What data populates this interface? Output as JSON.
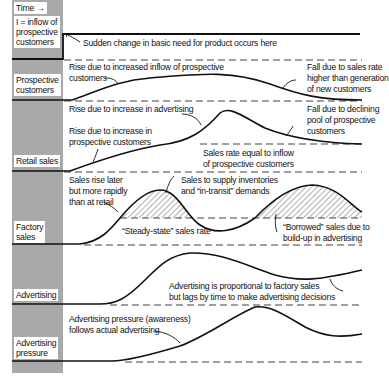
{
  "sidebar": {
    "time_label": "Time",
    "labels": {
      "inflow": [
        "I = inflow of",
        "prospective",
        "customers"
      ],
      "prospective": [
        "Prospective",
        "customers"
      ],
      "retail": [
        "Retail sales"
      ],
      "factory": [
        "Factory",
        "sales"
      ],
      "advertising": [
        "Advertising"
      ],
      "pressure": [
        "Advertising",
        "pressure"
      ]
    }
  },
  "panels": {
    "inflow": {
      "annotation": "Sudden change in basic need for product occurs here"
    },
    "prospective": {
      "rise": [
        "Rise due to increased inflow of prospective",
        "customers"
      ],
      "fall": [
        "Fall due to sales rate",
        "higher than generation",
        "of new customers"
      ]
    },
    "retail": {
      "rise_adv": "Rise due to increase in advertising",
      "rise_prosp": [
        "Rise due to increase in",
        "prospective customers"
      ],
      "fall": [
        "Fall due to declining",
        "pool of prospective",
        "customers"
      ],
      "equal": [
        "Sales rate equal to inflow",
        "of prospective customers"
      ]
    },
    "factory": {
      "later": [
        "Sales rise later",
        "but more rapidly",
        "than at retail"
      ],
      "supply": [
        "Sales to supply inventories",
        "and “in-transit” demands"
      ],
      "steady": "“Steady-state” sales rate",
      "borrowed": [
        "“Borrowed” sales due to",
        "build-up in advertising"
      ]
    },
    "advertising": {
      "note": [
        "Advertising is proportional to factory sales",
        "but lags by time to make advertising decisions"
      ]
    },
    "pressure": {
      "note": [
        "Advertising pressure (awareness)",
        "follows actual advertising"
      ]
    }
  },
  "colors": {
    "sidebar": "#a9a9a9",
    "ink": "#111111",
    "dash": "#444444"
  }
}
